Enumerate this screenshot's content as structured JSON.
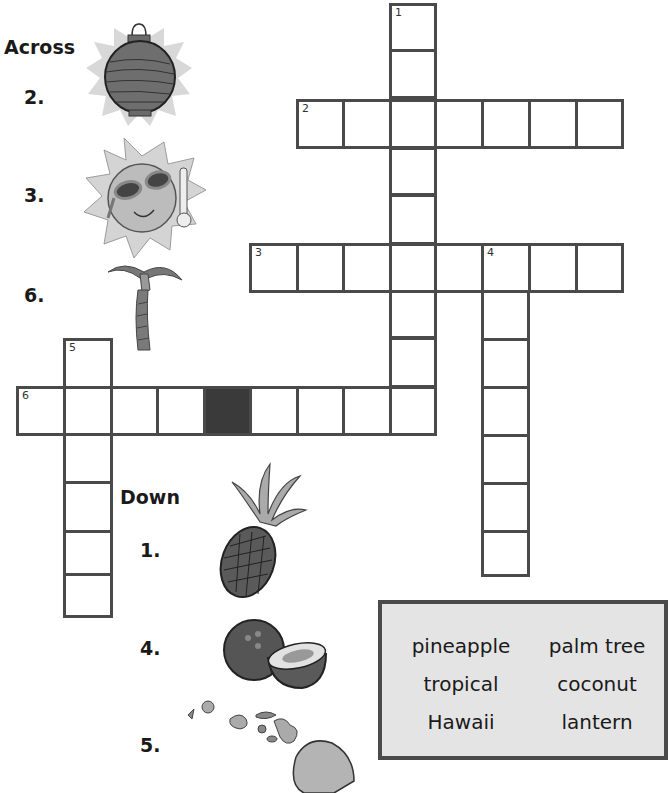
{
  "across": {
    "heading": "Across",
    "clues": [
      {
        "number": "2.",
        "picture": "lantern-icon"
      },
      {
        "number": "3.",
        "picture": "hot-sun-icon"
      },
      {
        "number": "6.",
        "picture": "palm-tree-icon"
      }
    ]
  },
  "down": {
    "heading": "Down",
    "clues": [
      {
        "number": "1.",
        "picture": "pineapple-icon"
      },
      {
        "number": "4.",
        "picture": "coconut-icon"
      },
      {
        "number": "5.",
        "picture": "hawaii-islands-icon"
      }
    ]
  },
  "grid": {
    "cell_numbers": {
      "c1": "1",
      "c2": "2",
      "c3": "3",
      "c4": "4",
      "c5": "5",
      "c6": "6"
    }
  },
  "word_bank": {
    "words": [
      "pineapple",
      "palm tree",
      "tropical",
      "coconut",
      "Hawaii",
      "lantern"
    ]
  },
  "colors": {
    "grid_border": "#4a4a4a",
    "block": "#3a3a3a",
    "word_bank_bg": "#e4e4e4"
  }
}
